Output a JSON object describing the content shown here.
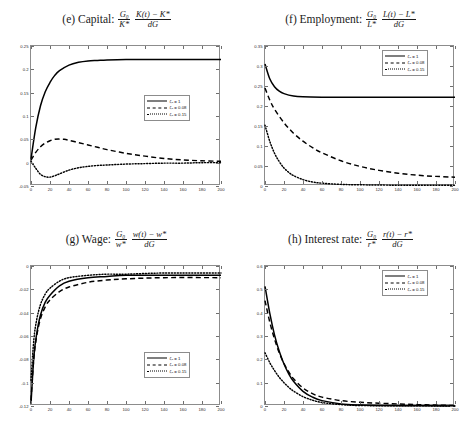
{
  "figure": {
    "background": "#ffffff",
    "line_color": "#000000",
    "axis_color": "#8c8c8c"
  },
  "legend_entries": [
    {
      "style": "solid",
      "label": "ζ₀ = 1"
    },
    {
      "style": "dashed",
      "label": "ζ₀ = 0.08"
    },
    {
      "style": "dotted",
      "label": "ζ₀ = 0.15"
    }
  ],
  "panels": {
    "e": {
      "tag": "(e)",
      "name": "Capital:",
      "formula_num_1": "G₀",
      "formula_den_1": "K*",
      "formula_num_2": "K(t) − K*",
      "formula_den_2": "dG",
      "title_plain": "(e) Capital: (G₀/K*)(K(t)−K*)/dG"
    },
    "f": {
      "tag": "(f)",
      "name": "Employment:",
      "formula_num_1": "G₀",
      "formula_den_1": "L*",
      "formula_num_2": "L(t) − L*",
      "formula_den_2": "dG",
      "title_plain": "(f) Employment: (G₀/L*)(L(t)−L*)/dG"
    },
    "g": {
      "tag": "(g)",
      "name": "Wage:",
      "formula_num_1": "G₀",
      "formula_den_1": "w*",
      "formula_num_2": "w(t) − w*",
      "formula_den_2": "dG",
      "title_plain": "(g) Wage: (G₀/w*)(w(t)−w*)/dG"
    },
    "h": {
      "tag": "(h)",
      "name": "Interest rate:",
      "formula_num_1": "G₀",
      "formula_den_1": "r*",
      "formula_num_2": "r(t) − r*",
      "formula_den_2": "dG",
      "title_plain": "(h) Interest rate: (G₀/r*)(r(t)−r*)/dG"
    }
  },
  "chart_data": [
    {
      "id": "e",
      "type": "line",
      "title": "(e) Capital: (G0/K*)(K(t)-K*)/dG",
      "xlabel": "",
      "ylabel": "",
      "xlim": [
        0,
        200
      ],
      "ylim": [
        -0.05,
        0.25
      ],
      "xticks": [
        0,
        20,
        40,
        60,
        80,
        100,
        120,
        140,
        160,
        180,
        200
      ],
      "yticks": [
        -0.05,
        0,
        0.05,
        0.1,
        0.15,
        0.2,
        0.25
      ],
      "ytick_labels": [
        "-0.05",
        "0",
        "0.05",
        "0.1",
        "0.15",
        "0.2",
        "0.25"
      ],
      "grid": false,
      "legend_position": "center-right",
      "series": [
        {
          "name": "ζ₀ = 1",
          "style": "solid",
          "x": [
            0,
            5,
            10,
            15,
            20,
            25,
            30,
            40,
            50,
            60,
            70,
            80,
            100,
            120,
            140,
            160,
            180,
            200
          ],
          "y": [
            0.008,
            0.075,
            0.122,
            0.152,
            0.172,
            0.187,
            0.197,
            0.209,
            0.215,
            0.218,
            0.219,
            0.22,
            0.221,
            0.221,
            0.221,
            0.221,
            0.221,
            0.221
          ]
        },
        {
          "name": "ζ₀ = 0.08",
          "style": "dashed",
          "x": [
            0,
            5,
            10,
            15,
            20,
            25,
            30,
            35,
            40,
            50,
            60,
            70,
            80,
            100,
            120,
            140,
            160,
            180,
            200
          ],
          "y": [
            0.005,
            0.022,
            0.034,
            0.042,
            0.047,
            0.05,
            0.0505,
            0.05,
            0.048,
            0.043,
            0.038,
            0.033,
            0.028,
            0.02,
            0.014,
            0.009,
            0.006,
            0.004,
            0.003
          ]
        },
        {
          "name": "ζ₀ = 0.15",
          "style": "dotted",
          "x": [
            0,
            5,
            10,
            15,
            20,
            25,
            30,
            40,
            50,
            60,
            70,
            80,
            100,
            120,
            140,
            160,
            180,
            200
          ],
          "y": [
            0.003,
            -0.012,
            -0.025,
            -0.03,
            -0.031,
            -0.028,
            -0.024,
            -0.016,
            -0.011,
            -0.008,
            -0.006,
            -0.005,
            -0.003,
            -0.002,
            -0.001,
            -0.001,
            0.0,
            0.0
          ]
        }
      ]
    },
    {
      "id": "f",
      "type": "line",
      "title": "(f) Employment: (G0/L*)(L(t)-L*)/dG",
      "xlabel": "",
      "ylabel": "",
      "xlim": [
        0,
        200
      ],
      "ylim": [
        0,
        0.35
      ],
      "xticks": [
        0,
        20,
        40,
        60,
        80,
        100,
        120,
        140,
        160,
        180,
        200
      ],
      "yticks": [
        0,
        0.05,
        0.1,
        0.15,
        0.2,
        0.25,
        0.3,
        0.35
      ],
      "ytick_labels": [
        "0",
        "0.05",
        "0.1",
        "0.15",
        "0.2",
        "0.25",
        "0.3",
        "0.35"
      ],
      "grid": false,
      "legend_position": "top-right",
      "series": [
        {
          "name": "ζ₀ = 1",
          "style": "solid",
          "x": [
            0,
            5,
            10,
            15,
            20,
            30,
            40,
            60,
            80,
            100,
            140,
            200
          ],
          "y": [
            0.305,
            0.268,
            0.248,
            0.237,
            0.231,
            0.225,
            0.223,
            0.222,
            0.222,
            0.222,
            0.222,
            0.222
          ]
        },
        {
          "name": "ζ₀ = 0.08",
          "style": "dashed",
          "x": [
            0,
            5,
            10,
            20,
            30,
            40,
            50,
            60,
            80,
            100,
            120,
            140,
            160,
            180,
            200
          ],
          "y": [
            0.245,
            0.215,
            0.192,
            0.158,
            0.132,
            0.112,
            0.096,
            0.083,
            0.063,
            0.049,
            0.039,
            0.032,
            0.027,
            0.024,
            0.022
          ]
        },
        {
          "name": "ζ₀ = 0.15",
          "style": "dotted",
          "x": [
            0,
            5,
            10,
            15,
            20,
            25,
            30,
            40,
            50,
            60,
            80,
            100,
            140,
            200
          ],
          "y": [
            0.152,
            0.112,
            0.082,
            0.061,
            0.045,
            0.034,
            0.026,
            0.016,
            0.01,
            0.007,
            0.004,
            0.003,
            0.002,
            0.002
          ]
        }
      ]
    },
    {
      "id": "g",
      "type": "line",
      "title": "(g) Wage: (G0/w*)(w(t)-w*)/dG",
      "xlabel": "",
      "ylabel": "",
      "xlim": [
        0,
        200
      ],
      "ylim": [
        -0.12,
        0
      ],
      "xticks": [
        0,
        20,
        40,
        60,
        80,
        100,
        120,
        140,
        160,
        180,
        200
      ],
      "yticks": [
        -0.12,
        -0.1,
        -0.08,
        -0.06,
        -0.04,
        -0.02,
        0
      ],
      "ytick_labels": [
        "-0.12",
        "-0.1",
        "-0.08",
        "-0.06",
        "-0.04",
        "-0.02",
        "0"
      ],
      "grid": false,
      "legend_position": "center-right",
      "series": [
        {
          "name": "ζ₀ = 1",
          "style": "solid",
          "x": [
            0,
            3,
            6,
            10,
            15,
            20,
            30,
            40,
            60,
            80,
            100,
            140,
            200
          ],
          "y": [
            -0.118,
            -0.078,
            -0.058,
            -0.042,
            -0.031,
            -0.025,
            -0.017,
            -0.013,
            -0.01,
            -0.009,
            -0.008,
            -0.008,
            -0.008
          ]
        },
        {
          "name": "ζ₀ = 0.08",
          "style": "dashed",
          "x": [
            0,
            3,
            6,
            10,
            15,
            20,
            30,
            40,
            60,
            80,
            100,
            140,
            200
          ],
          "y": [
            -0.115,
            -0.079,
            -0.06,
            -0.045,
            -0.035,
            -0.029,
            -0.022,
            -0.018,
            -0.014,
            -0.012,
            -0.011,
            -0.01,
            -0.01
          ]
        },
        {
          "name": "ζ₀ = 0.15",
          "style": "dotted",
          "x": [
            0,
            3,
            6,
            10,
            15,
            20,
            30,
            40,
            60,
            80,
            100,
            140,
            200
          ],
          "y": [
            -0.098,
            -0.063,
            -0.046,
            -0.033,
            -0.024,
            -0.019,
            -0.013,
            -0.01,
            -0.008,
            -0.007,
            -0.007,
            -0.006,
            -0.006
          ]
        }
      ]
    },
    {
      "id": "h",
      "type": "line",
      "title": "(h) Interest rate: (G0/r*)(r(t)-r*)/dG",
      "xlabel": "",
      "ylabel": "",
      "xlim": [
        0,
        200
      ],
      "ylim": [
        0,
        0.6
      ],
      "xticks": [
        0,
        20,
        40,
        60,
        80,
        100,
        120,
        140,
        160,
        180,
        200
      ],
      "yticks": [
        0,
        0.1,
        0.2,
        0.3,
        0.4,
        0.5,
        0.6
      ],
      "ytick_labels": [
        "0",
        "0.1",
        "0.2",
        "0.3",
        "0.4",
        "0.5",
        "0.6"
      ],
      "grid": false,
      "legend_position": "top-right",
      "series": [
        {
          "name": "ζ₀ = 1",
          "style": "solid",
          "x": [
            0,
            5,
            10,
            15,
            20,
            25,
            30,
            40,
            50,
            60,
            80,
            100,
            120,
            160,
            200
          ],
          "y": [
            0.513,
            0.398,
            0.305,
            0.235,
            0.18,
            0.138,
            0.106,
            0.063,
            0.038,
            0.023,
            0.009,
            0.004,
            0.002,
            0.001,
            0.0
          ]
        },
        {
          "name": "ζ₀ = 0.08",
          "style": "dashed",
          "x": [
            0,
            5,
            10,
            15,
            20,
            25,
            30,
            40,
            50,
            60,
            80,
            100,
            120,
            140,
            160,
            180,
            200
          ],
          "y": [
            0.452,
            0.36,
            0.287,
            0.228,
            0.182,
            0.146,
            0.117,
            0.077,
            0.053,
            0.038,
            0.023,
            0.016,
            0.012,
            0.009,
            0.006,
            0.004,
            0.002
          ]
        },
        {
          "name": "ζ₀ = 0.15",
          "style": "dotted",
          "x": [
            0,
            5,
            10,
            15,
            20,
            25,
            30,
            40,
            50,
            60,
            80,
            100,
            140,
            200
          ],
          "y": [
            0.228,
            0.186,
            0.152,
            0.123,
            0.1,
            0.08,
            0.064,
            0.04,
            0.025,
            0.015,
            0.006,
            0.002,
            0.001,
            0.0
          ]
        }
      ]
    }
  ]
}
